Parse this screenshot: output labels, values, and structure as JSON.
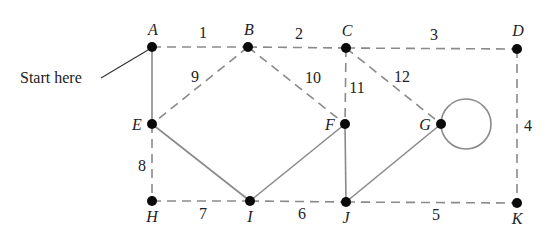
{
  "annotation": {
    "text": "Start here",
    "x": 20,
    "y": 83,
    "points_to": "A"
  },
  "colors": {
    "edge": "#8a8a8a",
    "node": "#0a0a0a",
    "text": "#222222"
  },
  "vertices": [
    {
      "id": "A",
      "label": "A",
      "x": 152,
      "y": 47,
      "lx": 153,
      "ly": 35
    },
    {
      "id": "B",
      "label": "B",
      "x": 248,
      "y": 47,
      "lx": 249,
      "ly": 35
    },
    {
      "id": "C",
      "label": "C",
      "x": 346,
      "y": 48,
      "lx": 347,
      "ly": 36
    },
    {
      "id": "D",
      "label": "D",
      "x": 517,
      "y": 49,
      "lx": 518,
      "ly": 36
    },
    {
      "id": "E",
      "label": "E",
      "x": 152,
      "y": 124,
      "lx": 137,
      "ly": 130
    },
    {
      "id": "F",
      "label": "F",
      "x": 345,
      "y": 124,
      "lx": 330,
      "ly": 130
    },
    {
      "id": "G",
      "label": "G",
      "x": 441,
      "y": 124,
      "lx": 425,
      "ly": 130
    },
    {
      "id": "H",
      "label": "H",
      "x": 152,
      "y": 201,
      "lx": 152,
      "ly": 222
    },
    {
      "id": "I",
      "label": "I",
      "x": 250,
      "y": 201,
      "lx": 250,
      "ly": 222
    },
    {
      "id": "J",
      "label": "J",
      "x": 346,
      "y": 202,
      "lx": 346,
      "ly": 223
    },
    {
      "id": "K",
      "label": "K",
      "x": 517,
      "y": 203,
      "lx": 517,
      "ly": 224
    }
  ],
  "edges": [
    {
      "from": "A",
      "to": "B",
      "style": "dashed",
      "label": "1",
      "lx": 203,
      "ly": 38
    },
    {
      "from": "B",
      "to": "C",
      "style": "dashed",
      "label": "2",
      "lx": 299,
      "ly": 39
    },
    {
      "from": "C",
      "to": "D",
      "style": "dashed",
      "label": "3",
      "lx": 434,
      "ly": 40
    },
    {
      "from": "D",
      "to": "K",
      "style": "dashed",
      "label": "4",
      "lx": 528,
      "ly": 131
    },
    {
      "from": "J",
      "to": "K",
      "style": "dashed",
      "label": "5",
      "lx": 436,
      "ly": 220
    },
    {
      "from": "I",
      "to": "J",
      "style": "dashed",
      "label": "6",
      "lx": 302,
      "ly": 219
    },
    {
      "from": "H",
      "to": "I",
      "style": "dashed",
      "label": "7",
      "lx": 203,
      "ly": 219
    },
    {
      "from": "E",
      "to": "H",
      "style": "dashed",
      "label": "8",
      "lx": 142,
      "ly": 171
    },
    {
      "from": "B",
      "to": "E",
      "style": "dashed",
      "label": "9",
      "lx": 195,
      "ly": 82
    },
    {
      "from": "B",
      "to": "F",
      "style": "dashed",
      "label": "10",
      "lx": 313,
      "ly": 83
    },
    {
      "from": "C",
      "to": "F",
      "style": "dashed",
      "label": "11",
      "lx": 357,
      "ly": 93
    },
    {
      "from": "C",
      "to": "G",
      "style": "dashed",
      "label": "12",
      "lx": 402,
      "ly": 82
    },
    {
      "from": "A",
      "to": "E",
      "style": "solid",
      "label": ""
    },
    {
      "from": "E",
      "to": "I",
      "style": "solid",
      "label": ""
    },
    {
      "from": "I",
      "to": "F",
      "style": "solid",
      "label": ""
    },
    {
      "from": "F",
      "to": "J",
      "style": "solid",
      "label": ""
    },
    {
      "from": "J",
      "to": "G",
      "style": "solid",
      "label": ""
    },
    {
      "from": "G",
      "to": "G",
      "style": "solid",
      "label": "",
      "loop": {
        "cx": 466,
        "cy": 124,
        "r": 25
      }
    }
  ]
}
